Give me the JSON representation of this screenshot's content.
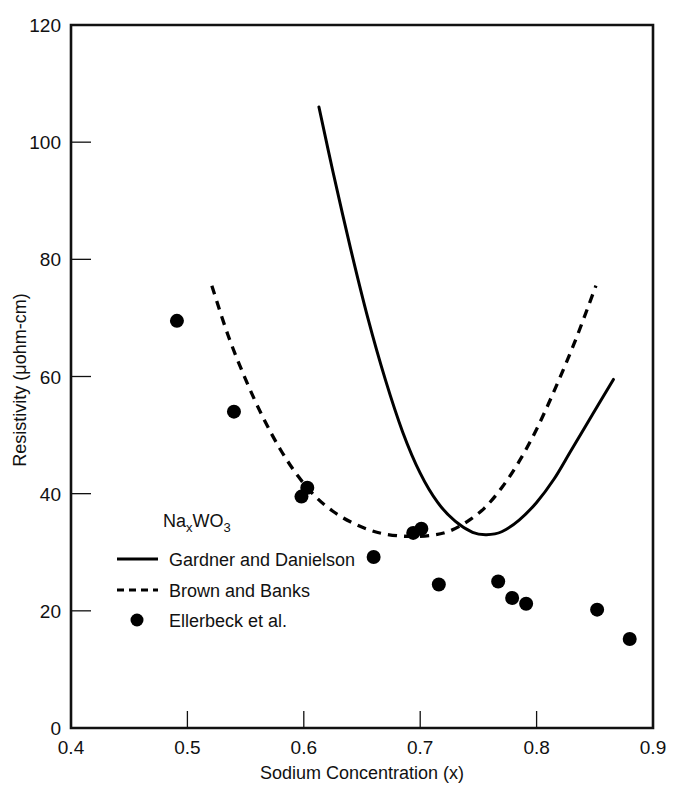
{
  "chart_data": {
    "type": "scatter",
    "title": "",
    "xlabel": "Sodium Concentration (x)",
    "ylabel": "Resistivity (μohm-cm)",
    "xlim": [
      0.4,
      0.9
    ],
    "ylim": [
      0,
      120
    ],
    "xticks": [
      "0.4",
      "0.5",
      "0.6",
      "0.7",
      "0.8",
      "0.9"
    ],
    "xtick_values": [
      0.4,
      0.5,
      0.6,
      0.7,
      0.8,
      0.9
    ],
    "yticks": [
      "0",
      "20",
      "40",
      "60",
      "80",
      "100",
      "120"
    ],
    "ytick_values": [
      0,
      20,
      40,
      60,
      80,
      100,
      120
    ],
    "grid": false,
    "legend_position": "lower-left-inside",
    "annotation": {
      "formula_base": "Na",
      "formula_sub1": "x",
      "formula_mid": "WO",
      "formula_sub2": "3"
    },
    "series": [
      {
        "name": "Gardner and Danielson",
        "style": "solid-line",
        "points": [
          [
            0.613,
            106.0
          ],
          [
            0.625,
            95.0
          ],
          [
            0.64,
            82.0
          ],
          [
            0.655,
            70.0
          ],
          [
            0.67,
            59.5
          ],
          [
            0.685,
            50.5
          ],
          [
            0.7,
            43.5
          ],
          [
            0.715,
            38.5
          ],
          [
            0.73,
            35.3
          ],
          [
            0.745,
            33.4
          ],
          [
            0.757,
            33.0
          ],
          [
            0.77,
            33.5
          ],
          [
            0.785,
            35.5
          ],
          [
            0.8,
            38.5
          ],
          [
            0.815,
            42.5
          ],
          [
            0.83,
            47.5
          ],
          [
            0.848,
            53.5
          ],
          [
            0.866,
            59.5
          ]
        ]
      },
      {
        "name": "Brown and Banks",
        "style": "dashed-line",
        "points": [
          [
            0.521,
            75.5
          ],
          [
            0.535,
            67.0
          ],
          [
            0.55,
            59.5
          ],
          [
            0.565,
            53.0
          ],
          [
            0.58,
            47.5
          ],
          [
            0.595,
            43.0
          ],
          [
            0.61,
            39.5
          ],
          [
            0.625,
            37.0
          ],
          [
            0.64,
            35.2
          ],
          [
            0.655,
            33.9
          ],
          [
            0.67,
            33.1
          ],
          [
            0.69,
            32.7
          ],
          [
            0.71,
            32.9
          ],
          [
            0.725,
            33.6
          ],
          [
            0.74,
            35.2
          ],
          [
            0.755,
            37.5
          ],
          [
            0.77,
            41.0
          ],
          [
            0.785,
            45.5
          ],
          [
            0.8,
            51.0
          ],
          [
            0.815,
            57.5
          ],
          [
            0.833,
            66.0
          ],
          [
            0.851,
            75.5
          ]
        ]
      },
      {
        "name": "Ellerbeck  et al.",
        "style": "filled-circle",
        "points": [
          [
            0.491,
            69.5
          ],
          [
            0.54,
            54.0
          ],
          [
            0.598,
            39.5
          ],
          [
            0.603,
            41.0
          ],
          [
            0.66,
            29.2
          ],
          [
            0.694,
            33.3
          ],
          [
            0.701,
            34.0
          ],
          [
            0.716,
            24.5
          ],
          [
            0.767,
            25.0
          ],
          [
            0.779,
            22.2
          ],
          [
            0.791,
            21.2
          ],
          [
            0.852,
            20.2
          ],
          [
            0.88,
            15.2
          ]
        ]
      }
    ],
    "legend_entries": [
      {
        "label": "Gardner and Danielson",
        "key": "solid-line"
      },
      {
        "label": "Brown and Banks",
        "key": "dashed-line"
      },
      {
        "label": "Ellerbeck  et al.",
        "key": "filled-circle"
      }
    ]
  }
}
